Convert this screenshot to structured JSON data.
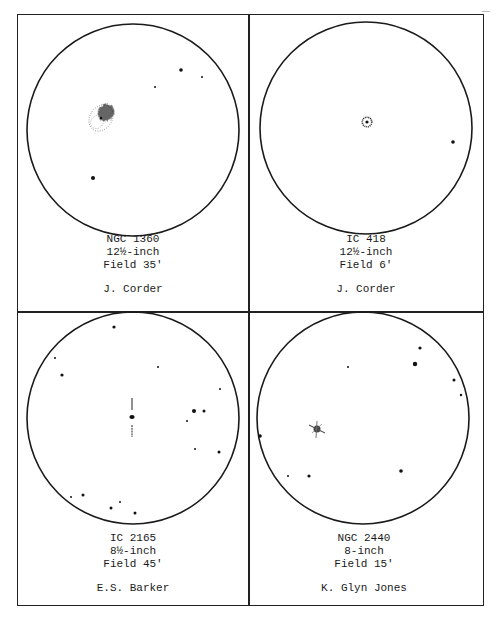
{
  "page": {
    "panels": [
      {
        "object": "NGC 1360",
        "aperture": "12½-inch",
        "field": "Field 35'",
        "observer": "J. Corder",
        "circle": {
          "cx": 133,
          "cy": 130,
          "r": 106
        },
        "stars": [
          {
            "x": 181,
            "y": 70,
            "r": 1.8
          },
          {
            "x": 202,
            "y": 77,
            "r": 1.0
          },
          {
            "x": 155,
            "y": 87,
            "r": 1.0
          },
          {
            "x": 93,
            "y": 178,
            "r": 2.0
          }
        ],
        "nebula": {
          "type": "planetary-mottled",
          "x": 101,
          "y": 118
        }
      },
      {
        "object": "IC 418",
        "aperture": "12½-inch",
        "field": "Field 6'",
        "observer": "J. Corder",
        "circle": {
          "cx": 366,
          "cy": 128,
          "r": 106
        },
        "stars": [
          {
            "x": 453,
            "y": 142,
            "r": 1.8
          }
        ],
        "nebula": {
          "type": "planetary-ring",
          "x": 367,
          "y": 122
        }
      },
      {
        "object": "IC 2165",
        "aperture": "8½-inch",
        "field": "Field 45'",
        "observer": "E.S. Barker",
        "circle": {
          "cx": 133,
          "cy": 418,
          "r": 106
        },
        "stars": [
          {
            "x": 114,
            "y": 327,
            "r": 1.6
          },
          {
            "x": 55,
            "y": 358,
            "r": 1.0
          },
          {
            "x": 62,
            "y": 375,
            "r": 1.6
          },
          {
            "x": 158,
            "y": 367,
            "r": 1.0
          },
          {
            "x": 220,
            "y": 389,
            "r": 1.0
          },
          {
            "x": 194,
            "y": 411,
            "r": 2.0
          },
          {
            "x": 204,
            "y": 411,
            "r": 1.5
          },
          {
            "x": 187,
            "y": 421,
            "r": 1.0
          },
          {
            "x": 195,
            "y": 449,
            "r": 1.0
          },
          {
            "x": 219,
            "y": 452,
            "r": 1.5
          },
          {
            "x": 71,
            "y": 497,
            "r": 1.0
          },
          {
            "x": 83,
            "y": 495,
            "r": 1.5
          },
          {
            "x": 120,
            "y": 502,
            "r": 1.0
          },
          {
            "x": 111,
            "y": 508,
            "r": 1.5
          },
          {
            "x": 135,
            "y": 513,
            "r": 1.5
          }
        ],
        "nebula": {
          "type": "stellar-with-markers",
          "x": 132,
          "y": 417
        }
      },
      {
        "object": "NGC 2440",
        "aperture": "8-inch",
        "field": "Field 15'",
        "observer": "K. Glyn Jones",
        "circle": {
          "cx": 363,
          "cy": 418,
          "r": 106
        },
        "stars": [
          {
            "x": 420,
            "y": 348,
            "r": 1.6
          },
          {
            "x": 415,
            "y": 364,
            "r": 2.2
          },
          {
            "x": 348,
            "y": 367,
            "r": 1.0
          },
          {
            "x": 454,
            "y": 380,
            "r": 1.5
          },
          {
            "x": 461,
            "y": 395,
            "r": 1.2
          },
          {
            "x": 260,
            "y": 436,
            "r": 1.8
          },
          {
            "x": 401,
            "y": 471,
            "r": 1.8
          },
          {
            "x": 288,
            "y": 476,
            "r": 1.0
          },
          {
            "x": 309,
            "y": 476,
            "r": 1.6
          }
        ],
        "nebula": {
          "type": "planetary-bipolar",
          "x": 317,
          "y": 429
        }
      }
    ]
  }
}
